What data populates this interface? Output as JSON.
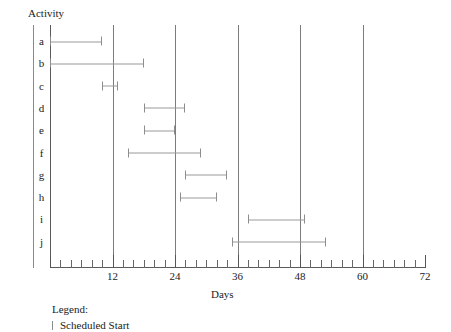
{
  "chart_data": {
    "type": "bar",
    "subtype": "gantt",
    "title": "",
    "xlabel": "Days",
    "ylabel": "Activity",
    "xlim": [
      0,
      72
    ],
    "xticks": [
      0,
      12,
      24,
      36,
      48,
      60,
      72
    ],
    "xtick_labels": [
      "",
      "12",
      "24",
      "36",
      "48",
      "60",
      "72"
    ],
    "minor_tick_interval": 2,
    "gridlines": [
      12,
      24,
      36,
      48,
      60
    ],
    "grid": true,
    "legend_position": "below-axes",
    "categories": [
      "a",
      "b",
      "c",
      "d",
      "e",
      "f",
      "g",
      "h",
      "i",
      "j"
    ],
    "bars": [
      {
        "activity": "a",
        "start": 0,
        "end": 10
      },
      {
        "activity": "b",
        "start": 0,
        "end": 18
      },
      {
        "activity": "c",
        "start": 10,
        "end": 13
      },
      {
        "activity": "d",
        "start": 18,
        "end": 26
      },
      {
        "activity": "e",
        "start": 18,
        "end": 24
      },
      {
        "activity": "f",
        "start": 15,
        "end": 29
      },
      {
        "activity": "g",
        "start": 26,
        "end": 34
      },
      {
        "activity": "h",
        "start": 25,
        "end": 32
      },
      {
        "activity": "i",
        "start": 38,
        "end": 49
      },
      {
        "activity": "j",
        "start": 35,
        "end": 53
      }
    ]
  },
  "axes": {
    "y_title": "Activity",
    "x_title": "Days"
  },
  "legend": {
    "title": "Legend:",
    "entries": [
      {
        "marker": "scheduled-start-marker",
        "label": "Scheduled Start"
      }
    ]
  }
}
